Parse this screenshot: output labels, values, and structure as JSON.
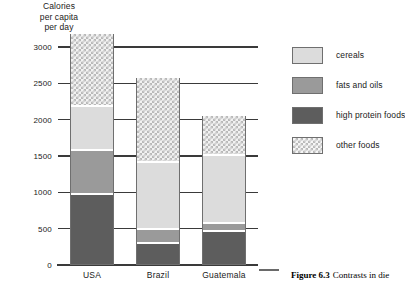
{
  "axis_title": {
    "line1": "Calories",
    "line2": "per capita",
    "line3": "per day"
  },
  "legend": {
    "items": [
      {
        "label": "cereals",
        "key": "cereals",
        "color": "#dcdcdc"
      },
      {
        "label": "fats and oils",
        "key": "fats",
        "color": "#9a9a9a"
      },
      {
        "label": "high protein foods",
        "key": "protein",
        "color": "#5d5d5d"
      },
      {
        "label": "other foods",
        "key": "other",
        "color": "#f2f2f2"
      }
    ]
  },
  "caption": {
    "figure_number": "Figure 6.3",
    "text": "Contrasts in die"
  },
  "chart_data": {
    "type": "bar",
    "stacked": true,
    "title": "",
    "xlabel": "",
    "ylabel": "Calories per capita per day",
    "ylim": [
      0,
      3000
    ],
    "yticks": [
      0,
      500,
      1000,
      1500,
      2000,
      2500,
      3000
    ],
    "ytick_labels": [
      "0",
      "500",
      "1000",
      "1500",
      "2000",
      "2500",
      "3000"
    ],
    "grid": true,
    "legend_position": "right",
    "categories": [
      "USA",
      "Brazil",
      "Guatemala"
    ],
    "series": [
      {
        "name": "high protein foods",
        "values": [
          960,
          290,
          450
        ]
      },
      {
        "name": "fats and oils",
        "values": [
          610,
          190,
          110
        ]
      },
      {
        "name": "cereals",
        "values": [
          610,
          920,
          940
        ]
      },
      {
        "name": "other foods",
        "values": [
          1000,
          1180,
          550
        ]
      }
    ],
    "totals": [
      3180,
      2580,
      2050
    ]
  }
}
